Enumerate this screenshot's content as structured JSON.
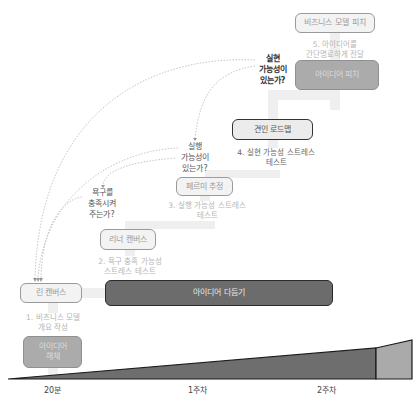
{
  "diagram": {
    "stages": [
      {
        "id": "business-model-pitch",
        "label": "비즈니스 모델 피치"
      },
      {
        "id": "idea-pitch",
        "label": "아이디어 피치"
      },
      {
        "id": "traction-roadmap",
        "label": "견인 로드맵"
      },
      {
        "id": "fermi-estimate",
        "label": "페르미 추정"
      },
      {
        "id": "lean-canvas-2",
        "label": "리너 캔버스"
      },
      {
        "id": "lean-canvas",
        "label": "린 캔버스"
      },
      {
        "id": "idea-refine",
        "label": "아이디어 다듬기"
      },
      {
        "id": "idea-breakdown",
        "label": "아이디어\n해체"
      }
    ],
    "step_labels": [
      {
        "id": "step5",
        "text": "5. 아이디어를\n간단명료하게 전달"
      },
      {
        "id": "step4",
        "text": "4. 실현 가능성 스트레스\n테스트"
      },
      {
        "id": "step3",
        "text": "3. 실행 가능성 스트레스\n테스트"
      },
      {
        "id": "step2",
        "text": "2. 욕구 충족 가능성\n스트레스 테스트"
      },
      {
        "id": "step1",
        "text": "1. 비즈니스 모델\n개요 작성"
      }
    ],
    "questions": [
      {
        "id": "q-feasible",
        "text": "실현\n가능성이\n있는가?"
      },
      {
        "id": "q-viable",
        "text": "실행\n가능성이\n있는가?"
      },
      {
        "id": "q-desirable",
        "text": "욕구를\n충족시켜\n주는가?"
      }
    ],
    "timeline": {
      "ticks": [
        "20분",
        "1주차",
        "2주차"
      ],
      "colors": {
        "main": "#6e6e6e",
        "tail": "#aaaaaa",
        "stroke": "#1a1a1a"
      }
    }
  }
}
